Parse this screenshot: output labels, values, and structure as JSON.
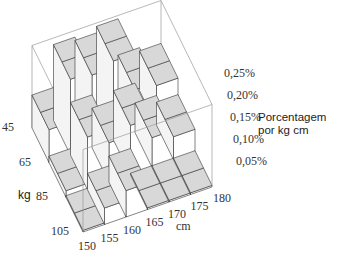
{
  "chart_data": {
    "type": "bar3d",
    "title": "",
    "xlabel": "cm",
    "ylabel": "kg",
    "zlabel_lines": [
      "Porcentagem",
      "por kg cm"
    ],
    "x_ticks": [
      "150",
      "155",
      "160",
      "165",
      "170",
      "175",
      "180"
    ],
    "y_ticks": [
      "45",
      "65",
      "85",
      "105"
    ],
    "z_ticks": [
      "0,05%",
      "0,10%",
      "0,15%",
      "0,20%",
      "0,25%"
    ],
    "zlim": [
      0,
      0.25
    ],
    "x_bins": [
      "150-155",
      "155-160",
      "160-165",
      "165-170",
      "170-175",
      "175-180"
    ],
    "y_bins": [
      "45-65",
      "65-85",
      "85-105"
    ],
    "values": [
      [
        0.1,
        0.23,
        0.22,
        0.24,
        0.13,
        0.12
      ],
      [
        0.02,
        0.16,
        0.12,
        0.15,
        0.09,
        0.07
      ],
      [
        0.005,
        0.05,
        0.08,
        0.005,
        0.005,
        0.005
      ]
    ],
    "colors": {
      "bar_side": "#ffffff",
      "bar_top": "#d8d8d8",
      "edge": "#333333",
      "box": "#999999"
    }
  }
}
